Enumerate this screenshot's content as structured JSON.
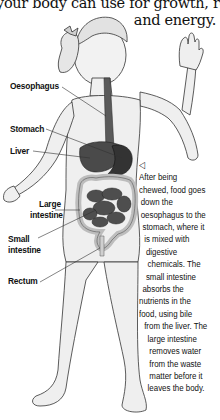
{
  "intro_text": {
    "line1": "your body can use for growth, repair",
    "line2": "and energy."
  },
  "figure": {
    "labels": {
      "oesophagus": "Oesophagus",
      "stomach": "Stomach",
      "liver": "Liver",
      "large_intestine_1": "Large",
      "large_intestine_2": "intestine",
      "small_intestine_1": "Small",
      "small_intestine_2": "intestine",
      "rectum": "Rectum"
    }
  },
  "caption": {
    "pointer_icon": "left-triangle-pointer",
    "pointer_glyph": "◁",
    "lines": [
      "After being",
      "chewed, food goes",
      "down the",
      "oesophagus to the",
      "stomach, where it",
      "is mixed with",
      "digestive",
      "chemicals. The",
      "small intestine",
      "absorbs the",
      "nutrients in the",
      "food, using bile",
      "from the liver. The",
      "large intestine",
      "removes water",
      "from the waste",
      "matter before it",
      "leaves the body."
    ]
  },
  "colors": {
    "ink": "#111111",
    "skin_light": "#ececec",
    "skin_shade": "#c9c9c9",
    "organ_dark": "#3a3a3a",
    "organ_mid": "#5a5a5a",
    "intestine_light": "#d6d6d6"
  }
}
